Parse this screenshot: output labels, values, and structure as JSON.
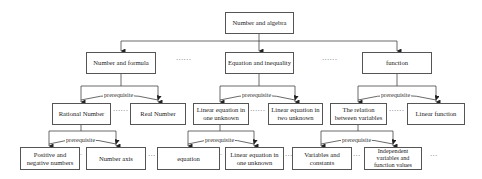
{
  "diagram": {
    "root": "Number and algebra",
    "level1": [
      "Number and formula",
      "Equation and inequality",
      "function"
    ],
    "level2": [
      "Rational Number",
      "Real Number",
      "Linear equation in one unknown",
      "Linear equation in two unknown",
      "The relation between variables",
      "Linear function"
    ],
    "level3": [
      "Positive and negative numbers",
      "Number axis",
      "equation",
      "Linear equation in one unknown",
      "Variables and constants",
      "Independent variables and function values"
    ],
    "relation_label": "prerequisite",
    "ellipsis_long": "······",
    "ellipsis_short": "···"
  }
}
